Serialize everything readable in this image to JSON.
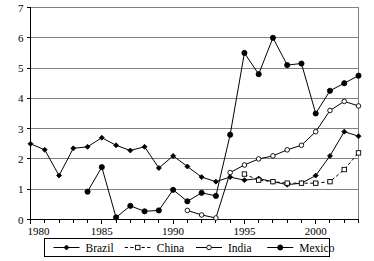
{
  "chart_data": {
    "type": "line",
    "title": "",
    "subtitle": "",
    "xlabel": "",
    "ylabel": "",
    "xlim": [
      1980,
      2003
    ],
    "ylim": [
      0,
      7
    ],
    "yticks": [
      0,
      1,
      2,
      3,
      4,
      5,
      6,
      7
    ],
    "ytick_labels": [
      "0",
      "1",
      "2",
      "3",
      "4",
      "5",
      "6",
      "7"
    ],
    "xticks": [
      1980,
      1985,
      1990,
      1995,
      2000
    ],
    "xtick_labels": [
      "1980",
      "1985",
      "1990",
      "1995",
      "2000"
    ],
    "x_minor_tick_interval": 1,
    "grid": "horizontal",
    "legend_position": "bottom",
    "x": [
      1980,
      1981,
      1982,
      1983,
      1984,
      1985,
      1986,
      1987,
      1988,
      1989,
      1990,
      1991,
      1992,
      1993,
      1994,
      1995,
      1996,
      1997,
      1998,
      1999,
      2000,
      2001,
      2002,
      2003
    ],
    "series": [
      {
        "name": "Brazil",
        "marker": "filled-diamond",
        "line_style": "solid",
        "x": [
          1980,
          1981,
          1982,
          1983,
          1984,
          1985,
          1986,
          1987,
          1988,
          1989,
          1990,
          1991,
          1992,
          1993,
          1994,
          1995,
          1996,
          1997,
          1998,
          1999,
          2000,
          2001,
          2002,
          2003
        ],
        "values": [
          2.5,
          2.3,
          1.45,
          2.35,
          2.4,
          2.7,
          2.45,
          2.28,
          2.4,
          1.7,
          2.1,
          1.75,
          1.4,
          1.25,
          1.4,
          1.3,
          1.35,
          1.25,
          1.15,
          1.2,
          1.45,
          2.1,
          2.9,
          2.75
        ]
      },
      {
        "name": "China",
        "marker": "open-square",
        "line_style": "dashed",
        "x": [
          1995,
          1996,
          1997,
          1998,
          1999,
          2000,
          2001,
          2002,
          2003
        ],
        "values": [
          1.5,
          1.3,
          1.25,
          1.2,
          1.2,
          1.2,
          1.25,
          1.65,
          2.2
        ]
      },
      {
        "name": "India",
        "marker": "open-circle",
        "line_style": "solid",
        "x": [
          1991,
          1992,
          1993,
          1994,
          1995,
          1996,
          1997,
          1998,
          1999,
          2000,
          2001,
          2002,
          2003
        ],
        "values": [
          0.3,
          0.15,
          0.05,
          1.55,
          1.8,
          2.0,
          2.1,
          2.3,
          2.45,
          2.9,
          3.6,
          3.9,
          3.75
        ]
      },
      {
        "name": "Mexico",
        "marker": "filled-circle",
        "line_style": "solid",
        "x": [
          1984,
          1985,
          1986,
          1987,
          1988,
          1989,
          1990,
          1991,
          1992,
          1993,
          1994,
          1995,
          1996,
          1997,
          1998,
          1999,
          2000,
          2001,
          2002,
          2003
        ],
        "values": [
          0.92,
          1.73,
          0.07,
          0.45,
          0.27,
          0.3,
          0.98,
          0.6,
          0.88,
          0.78,
          2.8,
          5.5,
          4.8,
          6.0,
          5.1,
          5.15,
          3.5,
          4.25,
          4.5,
          4.75
        ]
      }
    ],
    "legend": [
      {
        "label": "Brazil",
        "marker": "filled-diamond",
        "line_style": "solid"
      },
      {
        "label": "China",
        "marker": "open-square",
        "line_style": "dashed"
      },
      {
        "label": "India",
        "marker": "open-circle",
        "line_style": "solid"
      },
      {
        "label": "Mexico",
        "marker": "filled-circle",
        "line_style": "solid"
      }
    ],
    "colors": {
      "series": "#000000",
      "grid": "#808080",
      "axis": "#000000",
      "background": "#ffffff"
    }
  }
}
